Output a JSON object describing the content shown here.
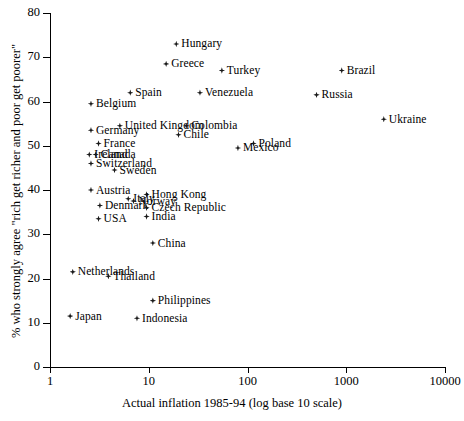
{
  "chart_data": {
    "type": "scatter",
    "title": "",
    "xlabel": "Actual inflation 1985-94 (log base 10 scale)",
    "ylabel": "% who strongly agree \"rich get richer and poor get poorer\"",
    "xscale": "log10",
    "xlim": [
      1,
      10000
    ],
    "ylim": [
      0,
      80
    ],
    "xticks": [
      "1",
      "10",
      "100",
      "1000",
      "10000"
    ],
    "xtick_values": [
      1,
      10,
      100,
      1000,
      10000
    ],
    "yticks": [
      "0",
      "10",
      "20",
      "30",
      "40",
      "50",
      "60",
      "70",
      "80"
    ],
    "ytick_values": [
      0,
      10,
      20,
      30,
      40,
      50,
      60,
      70,
      80
    ],
    "grid": false,
    "legend": "none",
    "points": [
      {
        "label": "Hungary",
        "x": 19,
        "y": 73.0,
        "side": "right"
      },
      {
        "label": "Greece",
        "x": 15,
        "y": 68.5,
        "side": "right"
      },
      {
        "label": "Turkey",
        "x": 55,
        "y": 67.0,
        "side": "right"
      },
      {
        "label": "Brazil",
        "x": 900,
        "y": 67.0,
        "side": "right"
      },
      {
        "label": "Spain",
        "x": 6.5,
        "y": 62.0,
        "side": "right"
      },
      {
        "label": "Venezuela",
        "x": 33,
        "y": 62.0,
        "side": "right"
      },
      {
        "label": "Russia",
        "x": 500,
        "y": 61.5,
        "side": "right"
      },
      {
        "label": "Belgium",
        "x": 2.6,
        "y": 59.5,
        "side": "right"
      },
      {
        "label": "Ukraine",
        "x": 2400,
        "y": 56.0,
        "side": "right"
      },
      {
        "label": "United Kingdom",
        "x": 5.1,
        "y": 54.5,
        "side": "right"
      },
      {
        "label": "Colombia",
        "x": 24,
        "y": 54.5,
        "side": "right"
      },
      {
        "label": "Germany",
        "x": 2.6,
        "y": 53.5,
        "side": "right"
      },
      {
        "label": "Chile",
        "x": 20,
        "y": 52.5,
        "side": "right"
      },
      {
        "label": "France",
        "x": 3.1,
        "y": 50.5,
        "side": "right"
      },
      {
        "label": "Poland",
        "x": 115,
        "y": 50.5,
        "side": "right"
      },
      {
        "label": "Mexico",
        "x": 80,
        "y": 49.5,
        "side": "right"
      },
      {
        "label": "Ireland",
        "x": 2.5,
        "y": 48.0,
        "side": "right"
      },
      {
        "label": "Canada",
        "x": 2.9,
        "y": 48.0,
        "side": "right"
      },
      {
        "label": "Switzerland",
        "x": 2.6,
        "y": 46.0,
        "side": "right"
      },
      {
        "label": "Sweden",
        "x": 4.5,
        "y": 44.5,
        "side": "right"
      },
      {
        "label": "Austria",
        "x": 2.6,
        "y": 40.0,
        "side": "right"
      },
      {
        "label": "Hong Kong",
        "x": 9.5,
        "y": 39.0,
        "side": "right"
      },
      {
        "label": "Italy",
        "x": 6.2,
        "y": 38.0,
        "side": "right"
      },
      {
        "label": "Norway",
        "x": 7.0,
        "y": 37.5,
        "side": "right"
      },
      {
        "label": "Denmark",
        "x": 3.2,
        "y": 36.5,
        "side": "right"
      },
      {
        "label": "Czech Republic",
        "x": 9.5,
        "y": 36.0,
        "side": "right"
      },
      {
        "label": "India",
        "x": 9.5,
        "y": 34.0,
        "side": "right"
      },
      {
        "label": "USA",
        "x": 3.1,
        "y": 33.5,
        "side": "right"
      },
      {
        "label": "China",
        "x": 11,
        "y": 28.0,
        "side": "right"
      },
      {
        "label": "Netherlands",
        "x": 1.7,
        "y": 21.5,
        "side": "right"
      },
      {
        "label": "Thailand",
        "x": 3.9,
        "y": 20.5,
        "side": "right"
      },
      {
        "label": "Philippines",
        "x": 11,
        "y": 15.0,
        "side": "right"
      },
      {
        "label": "Japan",
        "x": 1.6,
        "y": 11.5,
        "side": "right"
      },
      {
        "label": "Indonesia",
        "x": 7.6,
        "y": 11.0,
        "side": "right"
      }
    ]
  }
}
